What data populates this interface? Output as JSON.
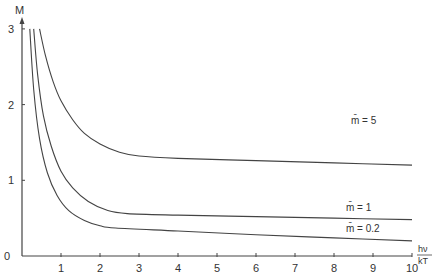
{
  "chart_data": {
    "type": "line",
    "title": "",
    "xlabel": "hν/kT",
    "ylabel": "M",
    "xlim": [
      0,
      10
    ],
    "ylim": [
      0,
      3
    ],
    "grid": false,
    "legend_position": "inline labels at right end of curves",
    "x_ticks": [
      "1",
      "2",
      "3",
      "4",
      "5",
      "6",
      "7",
      "8",
      "9",
      "10"
    ],
    "y_ticks": [
      "0",
      "1",
      "2",
      "3"
    ],
    "series": [
      {
        "name": "m̄ = 5",
        "x": [
          0.45,
          0.6,
          0.8,
          1.0,
          1.3,
          1.6,
          2.0,
          2.5,
          3.0,
          4.0,
          6.0,
          8.0,
          10.0
        ],
        "y": [
          3.0,
          2.65,
          2.3,
          2.05,
          1.8,
          1.62,
          1.48,
          1.37,
          1.32,
          1.29,
          1.26,
          1.23,
          1.2
        ]
      },
      {
        "name": "m̄ = 1",
        "x": [
          0.3,
          0.4,
          0.55,
          0.75,
          1.0,
          1.3,
          1.7,
          2.2,
          2.7,
          4.0,
          6.0,
          8.0,
          10.0
        ],
        "y": [
          3.0,
          2.4,
          1.85,
          1.45,
          1.12,
          0.9,
          0.72,
          0.6,
          0.56,
          0.54,
          0.52,
          0.5,
          0.48
        ]
      },
      {
        "name": "m̄ = 0.2",
        "x": [
          0.2,
          0.3,
          0.45,
          0.65,
          0.9,
          1.2,
          1.6,
          2.0,
          2.4,
          4.0,
          6.0,
          8.0,
          10.0
        ],
        "y": [
          3.0,
          2.2,
          1.55,
          1.1,
          0.8,
          0.6,
          0.47,
          0.4,
          0.37,
          0.33,
          0.28,
          0.24,
          0.2
        ]
      }
    ],
    "annotations": [
      "m̄ = 5",
      "m̄ = 1",
      "m̄ = 0.2"
    ]
  },
  "labels": {
    "y_axis": "M",
    "x_axis_num": "hν",
    "x_axis_den": "kT",
    "origin": "0",
    "curve_5": "m̄ = 5",
    "curve_1": "m̄ = 1",
    "curve_02": "m̄ = 0.2"
  }
}
